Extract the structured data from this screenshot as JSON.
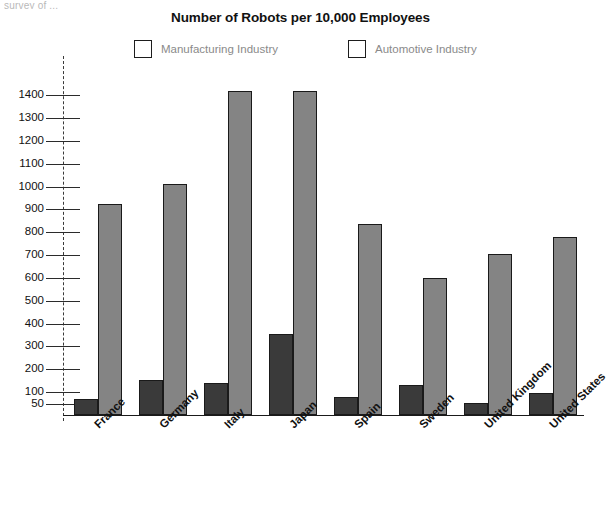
{
  "top_caption": "survey of ...",
  "chart_data": {
    "type": "bar",
    "title": "Number of Robots per 10,000 Employees",
    "xlabel": "",
    "ylabel": "",
    "ylim": [
      0,
      1450
    ],
    "grid": false,
    "legend_position": "top",
    "yticks": [
      50,
      100,
      200,
      300,
      400,
      500,
      600,
      700,
      800,
      900,
      1000,
      1100,
      1200,
      1300,
      1400
    ],
    "categories": [
      "France",
      "Germany",
      "Italy",
      "Japan",
      "Spain",
      "Sweden",
      "United Kingdom",
      "United States"
    ],
    "series": [
      {
        "name": "Manufacturing Industry",
        "color": "#3a3a3a",
        "values": [
          70,
          155,
          140,
          355,
          80,
          130,
          52,
          95
        ]
      },
      {
        "name": "Automotive Industry",
        "color": "#848484",
        "values": [
          925,
          1010,
          1420,
          1420,
          835,
          600,
          705,
          780
        ]
      }
    ]
  }
}
